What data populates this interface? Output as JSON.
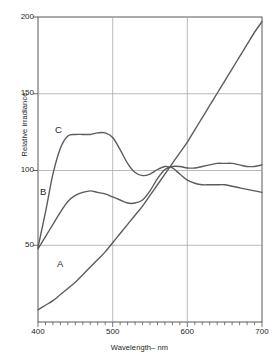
{
  "figure": {
    "background": "#ffffff",
    "axis_color": "#58595b",
    "grid_color": "#9a9b9d",
    "curve_color": "#5b5c5e"
  },
  "axes": {
    "y_title": "Relative irradiance",
    "x_title": "Wavelength– nm",
    "y_ticks": [
      "50",
      "100",
      "150",
      "200"
    ],
    "x_ticks": [
      "400",
      "500",
      "600",
      "700"
    ]
  },
  "curve_labels": {
    "a": "A",
    "b": "B",
    "c": "C"
  },
  "chart_data": {
    "type": "line",
    "title": "",
    "xlabel": "Wavelength– nm",
    "ylabel": "Relative irradiance",
    "xlim": [
      400,
      700
    ],
    "ylim": [
      0,
      200
    ],
    "grid": true,
    "legend": "inline-curve-labels",
    "x_ticks": [
      400,
      500,
      600,
      700
    ],
    "y_ticks": [
      50,
      100,
      150,
      200
    ],
    "x_minor_tick_step": 10,
    "series": [
      {
        "name": "A",
        "label": "A",
        "x": [
          400,
          410,
          420,
          430,
          440,
          450,
          460,
          470,
          480,
          490,
          500,
          510,
          520,
          530,
          540,
          550,
          560,
          570,
          580,
          590,
          600,
          610,
          620,
          630,
          640,
          650,
          660,
          670,
          680,
          690,
          700
        ],
        "values": [
          8,
          11,
          14,
          18,
          22,
          26,
          31,
          36,
          41,
          46,
          52,
          58,
          64,
          70,
          76,
          83,
          90,
          97,
          104,
          111,
          118,
          126,
          134,
          142,
          150,
          158,
          166,
          174,
          182,
          190,
          197
        ]
      },
      {
        "name": "B",
        "label": "B",
        "x": [
          400,
          410,
          420,
          430,
          440,
          450,
          460,
          470,
          480,
          490,
          500,
          510,
          520,
          530,
          540,
          550,
          560,
          570,
          580,
          590,
          600,
          610,
          620,
          630,
          640,
          650,
          660,
          670,
          680,
          690,
          700
        ],
        "values": [
          48,
          56,
          64,
          72,
          79,
          83,
          85,
          86,
          85,
          84,
          82,
          80,
          78,
          78,
          80,
          86,
          94,
          100,
          102,
          102,
          101,
          101,
          102,
          103,
          104,
          104,
          104,
          103,
          102,
          102,
          103
        ]
      },
      {
        "name": "C",
        "label": "C",
        "x": [
          400,
          410,
          420,
          430,
          440,
          450,
          460,
          470,
          480,
          490,
          500,
          510,
          520,
          530,
          540,
          550,
          560,
          570,
          580,
          590,
          600,
          610,
          620,
          630,
          640,
          650,
          660,
          670,
          680,
          690,
          700
        ],
        "values": [
          49,
          72,
          97,
          114,
          122,
          123,
          123,
          123,
          124,
          124,
          121,
          113,
          104,
          98,
          96,
          97,
          100,
          102,
          101,
          97,
          93,
          91,
          90,
          90,
          90,
          90,
          89,
          88,
          87,
          86,
          85
        ]
      }
    ]
  }
}
